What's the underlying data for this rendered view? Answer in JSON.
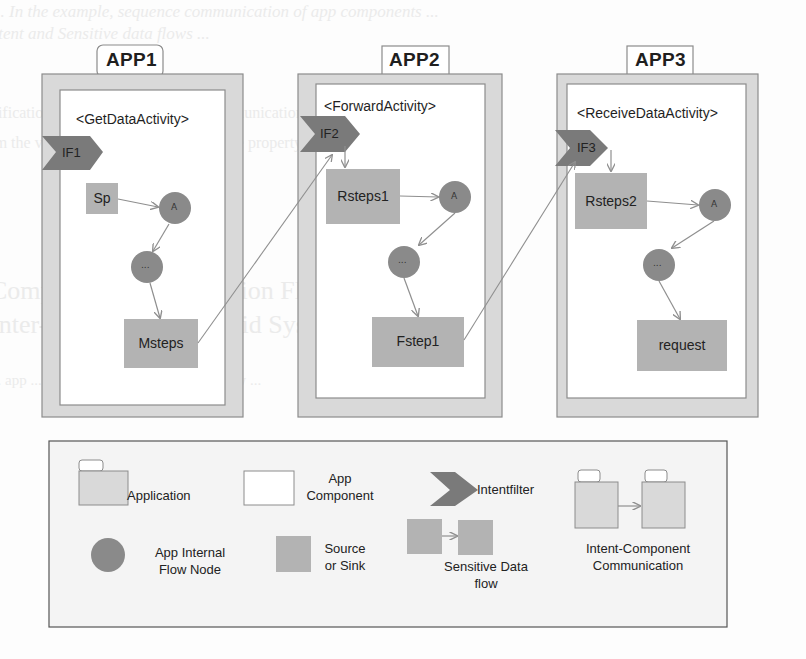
{
  "bleed_through_text": {
    "line1": "Fig. 1. In the example, sequence communication of app components ...",
    "line2": "for Intent and Sensitive data flows ...",
    "line3": "... Verification of Flows ... Android ... communication ...",
    "line4": "... from the verification ... the theorem ... the property ...",
    "line5": "Compositional Information Flow Verification for",
    "line6": "Inter-Application Android System",
    "line7": "... app ... verification ... component ... flow ..."
  },
  "apps": [
    {
      "tab_label": "APP1",
      "activity_label": "<GetDataActivity>",
      "intent_filter": "IF1",
      "nodes": {
        "source": "Sp",
        "internal_a": "A",
        "internal_dots": "...",
        "sink": "Msteps"
      }
    },
    {
      "tab_label": "APP2",
      "activity_label": "<ForwardActivity>",
      "intent_filter": "IF2",
      "nodes": {
        "source": "Rsteps1",
        "internal_a": "A",
        "internal_dots": "...",
        "sink": "Fstep1"
      }
    },
    {
      "tab_label": "APP3",
      "activity_label": "<ReceiveDataActivity>",
      "intent_filter": "IF3",
      "nodes": {
        "source": "Rsteps2",
        "internal_a": "A",
        "internal_dots": "...",
        "sink": "request"
      }
    }
  ],
  "legend": {
    "application": "Application",
    "app_component_1": "App",
    "app_component_2": "Component",
    "intentfilter": "Intentfilter",
    "internal_node_1": "App Internal",
    "internal_node_2": "Flow Node",
    "source_sink_1": "Source",
    "source_sink_2": "or Sink",
    "sensitive_flow_1": "Sensitive Data",
    "sensitive_flow_2": "flow",
    "icc_1": "Intent-Component",
    "icc_2": "Communication"
  },
  "colors": {
    "app_frame": "#d9d9d9",
    "frame_border": "#8c8c8c",
    "component_bg": "#ffffff",
    "source_sink": "#b3b3b3",
    "internal_node": "#8a8a8a",
    "intent_filter": "#7a7a7a",
    "arrow": "#8f8f8f"
  }
}
